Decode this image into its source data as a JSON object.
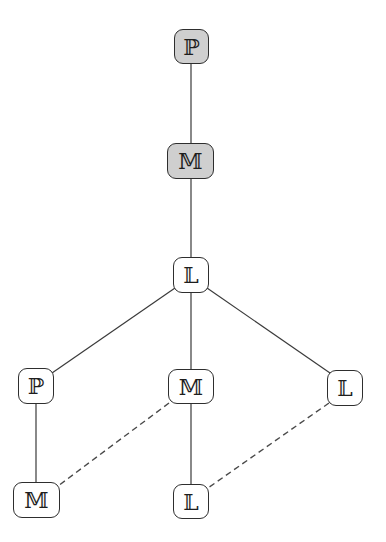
{
  "diagram": {
    "type": "hierarchy-tree",
    "colors": {
      "shaded_fill": "#cfcfcf",
      "node_fill": "#ffffff",
      "stroke": "#2e2e2e"
    },
    "nodes": [
      {
        "id": "n1",
        "label": "ℙ",
        "shaded": true
      },
      {
        "id": "n2",
        "label": "𝕄",
        "shaded": true
      },
      {
        "id": "n3",
        "label": "𝕃",
        "shaded": false
      },
      {
        "id": "n4",
        "label": "ℙ",
        "shaded": false
      },
      {
        "id": "n5",
        "label": "𝕄",
        "shaded": false
      },
      {
        "id": "n6",
        "label": "𝕃",
        "shaded": false
      },
      {
        "id": "n7",
        "label": "𝕄",
        "shaded": false
      },
      {
        "id": "n8",
        "label": "𝕃",
        "shaded": false
      }
    ],
    "edges": [
      {
        "from": "n1",
        "to": "n2",
        "style": "solid"
      },
      {
        "from": "n2",
        "to": "n3",
        "style": "solid"
      },
      {
        "from": "n3",
        "to": "n4",
        "style": "solid"
      },
      {
        "from": "n3",
        "to": "n5",
        "style": "solid"
      },
      {
        "from": "n3",
        "to": "n6",
        "style": "solid"
      },
      {
        "from": "n4",
        "to": "n7",
        "style": "solid"
      },
      {
        "from": "n5",
        "to": "n8",
        "style": "solid"
      },
      {
        "from": "n5",
        "to": "n7",
        "style": "dashed"
      },
      {
        "from": "n6",
        "to": "n8",
        "style": "dashed"
      }
    ]
  }
}
